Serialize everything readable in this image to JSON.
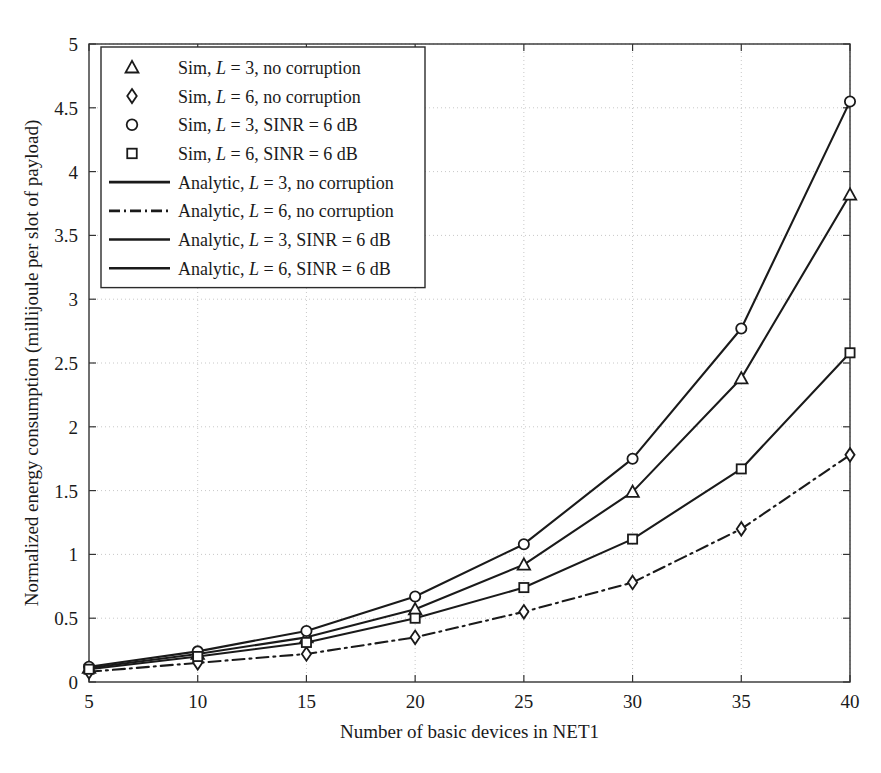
{
  "chart_data": {
    "type": "line",
    "title": "",
    "xlabel": "Number of basic devices in NET1",
    "ylabel": "Normalized energy consumption (millijoule per slot of payload)",
    "x": [
      5,
      10,
      15,
      20,
      25,
      30,
      35,
      40
    ],
    "xlim": [
      5,
      40
    ],
    "ylim": [
      0,
      5
    ],
    "xticks": [
      "5",
      "10",
      "15",
      "20",
      "25",
      "30",
      "35",
      "40"
    ],
    "yticks": [
      "0",
      "0.5",
      "1",
      "1.5",
      "2",
      "2.5",
      "3",
      "3.5",
      "4",
      "4.5",
      "5"
    ],
    "grid": true,
    "legend_position": "top-left",
    "series": [
      {
        "name": "Sim, L = 3, no corruption",
        "marker": "triangle",
        "linestyle": "solid",
        "color": "#1a1a1a",
        "values": [
          0.11,
          0.22,
          0.35,
          0.57,
          0.92,
          1.49,
          2.38,
          3.82
        ]
      },
      {
        "name": "Sim, L = 6, no corruption",
        "marker": "diamond",
        "linestyle": "dashdot",
        "color": "#1a1a1a",
        "values": [
          0.08,
          0.15,
          0.22,
          0.35,
          0.55,
          0.78,
          1.2,
          1.78
        ]
      },
      {
        "name": "Sim, L = 3, SINR = 6 dB",
        "marker": "circle",
        "linestyle": "solid",
        "color": "#1a1a1a",
        "values": [
          0.12,
          0.24,
          0.4,
          0.67,
          1.08,
          1.75,
          2.77,
          4.55
        ]
      },
      {
        "name": "Sim, L = 6, SINR = 6 dB",
        "marker": "square",
        "linestyle": "solid",
        "color": "#1a1a1a",
        "values": [
          0.1,
          0.2,
          0.31,
          0.5,
          0.74,
          1.12,
          1.67,
          2.58
        ]
      }
    ],
    "legend_entries": [
      {
        "marker": "triangle",
        "line": "none",
        "prefix": "Sim, ",
        "var": "L",
        "suffix": " = 3, no corruption"
      },
      {
        "marker": "diamond",
        "line": "none",
        "prefix": "Sim, ",
        "var": "L",
        "suffix": " = 6, no corruption"
      },
      {
        "marker": "circle",
        "line": "none",
        "prefix": "Sim, ",
        "var": "L",
        "suffix": " = 3, SINR = 6 dB"
      },
      {
        "marker": "square",
        "line": "none",
        "prefix": "Sim, ",
        "var": "L",
        "suffix": " = 6, SINR = 6 dB"
      },
      {
        "marker": "none",
        "line": "solid",
        "prefix": "Analytic, ",
        "var": "L",
        "suffix": " = 3, no corruption"
      },
      {
        "marker": "none",
        "line": "dashdot",
        "prefix": "Analytic, ",
        "var": "L",
        "suffix": " = 6, no corruption"
      },
      {
        "marker": "none",
        "line": "solid",
        "prefix": "Analytic, ",
        "var": "L",
        "suffix": " = 3, SINR = 6 dB"
      },
      {
        "marker": "none",
        "line": "solid",
        "prefix": "Analytic, ",
        "var": "L",
        "suffix": " = 6, SINR = 6 dB"
      }
    ]
  },
  "colors": {
    "line": "#1a1a1a",
    "grid": "#c8c8c8",
    "axis": "#333333",
    "background": "#ffffff"
  }
}
